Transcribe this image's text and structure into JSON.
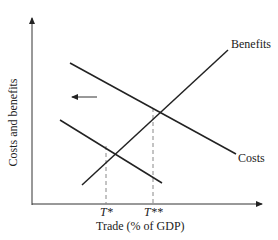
{
  "diagram": {
    "y_axis_label": "Costs and benefits",
    "x_axis_label": "Trade (% of GDP)",
    "curves": [
      {
        "name": "Benefits",
        "label": "Benefits",
        "from": [
          82,
          185
        ],
        "to": [
          228,
          50
        ]
      },
      {
        "name": "Costs",
        "label": "Costs",
        "from": [
          70,
          63
        ],
        "to": [
          236,
          154
        ]
      },
      {
        "name": "Costs (shifted)",
        "label": "",
        "from": [
          60,
          120
        ],
        "to": [
          162,
          183
        ]
      }
    ],
    "equilibria": [
      {
        "label": "T*",
        "x": 106,
        "y": 146
      },
      {
        "label": "T**",
        "x": 153,
        "y": 108
      }
    ],
    "shift_arrow": {
      "direction": "left",
      "from": [
        97,
        97
      ],
      "to": [
        70,
        97
      ]
    },
    "colors": {
      "line": "#222222",
      "dashed": "#888888"
    }
  }
}
